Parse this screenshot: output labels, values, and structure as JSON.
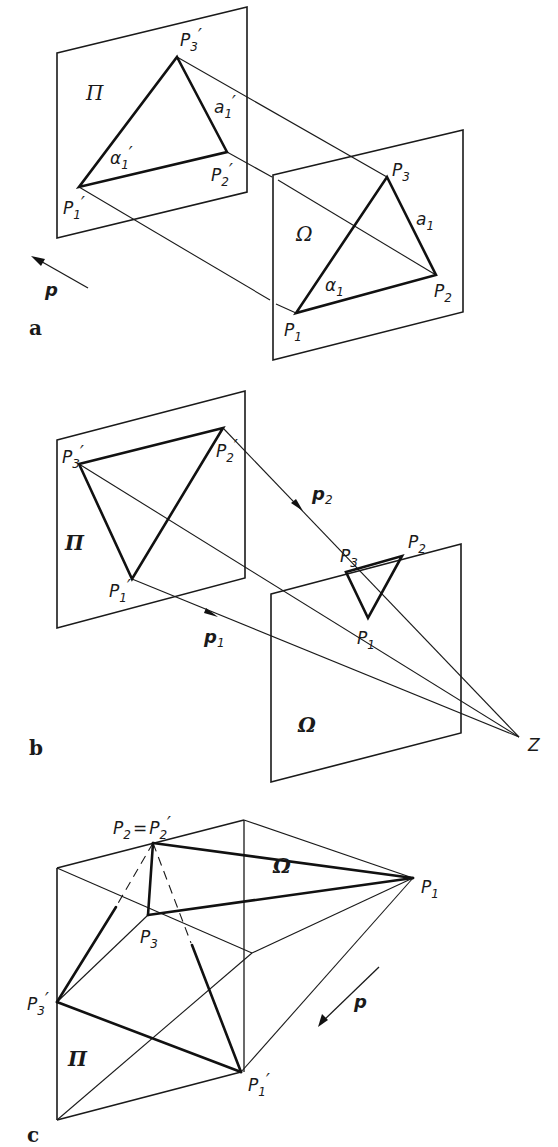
{
  "figure": {
    "panels": [
      {
        "id": "a",
        "label": "a",
        "planes": {
          "image": "Π",
          "object": "Ω"
        },
        "points_image": {
          "p1": "P",
          "p1_sub": "1",
          "p2": "P",
          "p2_sub": "2",
          "p3": "P",
          "p3_sub": "3",
          "prime": "′"
        },
        "points_object": {
          "p1": "P",
          "p1_sub": "1",
          "p2": "P",
          "p2_sub": "2",
          "p3": "P",
          "p3_sub": "3"
        },
        "angle_image": "α",
        "angle_image_sub": "1",
        "side_image": "a",
        "side_image_sub": "1",
        "angle_object": "α",
        "angle_object_sub": "1",
        "side_object": "a",
        "side_object_sub": "1",
        "direction": "p"
      },
      {
        "id": "b",
        "label": "b",
        "planes": {
          "image": "Π",
          "object": "Ω"
        },
        "center": "Z",
        "direction_1": "p",
        "direction_1_sub": "1",
        "direction_2": "p",
        "direction_2_sub": "2"
      },
      {
        "id": "c",
        "label": "c",
        "planes": {
          "image": "Π",
          "object": "Ω"
        },
        "coincident_label": "P",
        "coincident_eq": "=",
        "direction": "p"
      }
    ]
  }
}
